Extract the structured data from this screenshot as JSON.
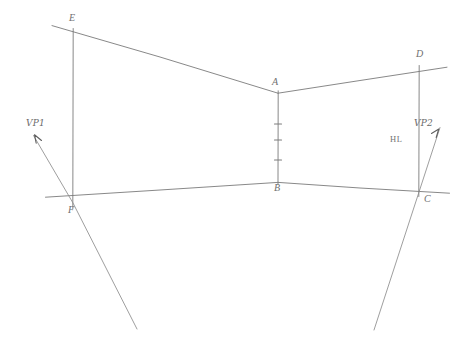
{
  "drawing": {
    "title": "Two-point perspective construction sketch",
    "medium": "pencil-on-paper line drawing",
    "background_color": "#ffffff",
    "line_color": "#7a7a7a",
    "label_color": "#6f6f6f",
    "canvas": {
      "width": 464,
      "height": 360
    }
  },
  "labels": {
    "vp1": "VP1",
    "vp2": "VP2",
    "horizon": "HL",
    "a": "A",
    "b": "B",
    "c": "C",
    "d": "D",
    "e": "E",
    "f": "F"
  },
  "points": {
    "A": {
      "x": 278,
      "y": 93
    },
    "B": {
      "x": 278,
      "y": 182
    },
    "C": {
      "x": 419,
      "y": 192
    },
    "D": {
      "x": 419,
      "y": 70
    },
    "E": {
      "x": 73,
      "y": 33
    },
    "F": {
      "x": 73,
      "y": 203
    }
  },
  "label_positions": {
    "vp1": {
      "x": 26,
      "y": 120
    },
    "vp2": {
      "x": 415,
      "y": 120
    },
    "horizon": {
      "x": 391,
      "y": 135
    },
    "a": {
      "x": 272,
      "y": 79
    },
    "b": {
      "x": 274,
      "y": 184
    },
    "c": {
      "x": 424,
      "y": 195
    },
    "d": {
      "x": 416,
      "y": 51
    },
    "e": {
      "x": 69,
      "y": 15
    },
    "f": {
      "x": 68,
      "y": 206
    }
  },
  "geometry": {
    "vertical_edges": [
      {
        "name": "edge-AB-center",
        "x": 278,
        "y1": 91,
        "y2": 184
      },
      {
        "name": "edge-EF-left",
        "x": 73,
        "y1": 29,
        "y2": 208
      },
      {
        "name": "edge-DC-right",
        "x": 419,
        "y1": 66,
        "y2": 196
      }
    ],
    "receding_lines": [
      {
        "name": "line-E-to-A",
        "x1": 52,
        "y1": 26,
        "x2": 278,
        "y2": 93
      },
      {
        "name": "line-A-to-D",
        "x1": 278,
        "y1": 93,
        "x2": 447,
        "y2": 67
      },
      {
        "name": "line-F-to-B",
        "x1": 45,
        "y1": 197,
        "x2": 278,
        "y2": 182
      },
      {
        "name": "line-B-to-C",
        "x1": 278,
        "y1": 182,
        "x2": 449,
        "y2": 193
      }
    ],
    "vanishing_rays": [
      {
        "name": "ray-vp1-through-F",
        "x1": 33,
        "y1": 136,
        "x2": 137,
        "y2": 329
      },
      {
        "name": "ray-vp2-through-C",
        "x1": 440,
        "y1": 128,
        "x2": 374,
        "y2": 330
      }
    ],
    "tick_marks": [
      {
        "name": "tick-1",
        "x": 278,
        "y": 124
      },
      {
        "name": "tick-2",
        "x": 278,
        "y": 140
      },
      {
        "name": "tick-3",
        "x": 278,
        "y": 160
      }
    ],
    "arrowheads": [
      {
        "name": "arrowhead-vp1",
        "tip_x": 35,
        "tip_y": 134
      },
      {
        "name": "arrowhead-vp2",
        "tip_x": 438,
        "tip_y": 130
      }
    ]
  }
}
